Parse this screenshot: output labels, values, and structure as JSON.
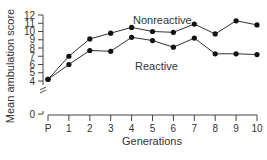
{
  "chart_data": {
    "type": "line",
    "title": "",
    "xlabel": "Generations",
    "ylabel": "Mean ambulation score",
    "categories": [
      "P",
      "1",
      "2",
      "3",
      "4",
      "5",
      "6",
      "7",
      "8",
      "9",
      "10"
    ],
    "yticks": [
      0,
      4,
      5,
      6,
      7,
      8,
      9,
      10,
      11,
      12
    ],
    "ylim": [
      0,
      12
    ],
    "axis_break": true,
    "grid": false,
    "legend": "inline labels",
    "series": [
      {
        "name": "Nonreactive",
        "values": [
          4.2,
          7.0,
          9.1,
          9.8,
          10.5,
          10.0,
          9.9,
          10.9,
          9.7,
          11.3,
          10.8
        ]
      },
      {
        "name": "Reactive",
        "values": [
          4.2,
          6.0,
          7.7,
          7.6,
          9.3,
          8.9,
          8.1,
          9.2,
          7.3,
          7.3,
          7.2
        ]
      }
    ]
  }
}
